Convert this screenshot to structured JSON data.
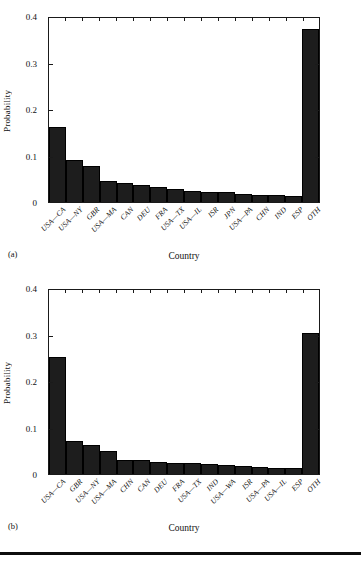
{
  "figure": {
    "panels": [
      {
        "tag": "(a)",
        "xaxis_title": "Country",
        "yaxis_title": "Probability"
      },
      {
        "tag": "(b)",
        "xaxis_title": "Country",
        "yaxis_title": "Probability"
      }
    ],
    "accent_color": "#1d1d1d",
    "axis_color": "#1a1a1a",
    "background_color": "#ffffff"
  },
  "chart_data": [
    {
      "type": "bar",
      "panel": "(a)",
      "title": "",
      "xlabel": "Country",
      "ylabel": "Probability",
      "ylim": [
        0,
        0.4
      ],
      "yticks": [
        0,
        0.1,
        0.2,
        0.3,
        0.4
      ],
      "ytick_labels": [
        "0",
        "0.1",
        "0.2",
        "0.3",
        "0.4"
      ],
      "grid": false,
      "legend": "none",
      "categories": [
        "USA—CA",
        "USA—NY",
        "GBR",
        "USA—MA",
        "CAN",
        "DEU",
        "FRA",
        "USA—TX",
        "USA—IL",
        "ISR",
        "JPN",
        "USA—PA",
        "CHN",
        "IND",
        "ESP",
        "OTH"
      ],
      "values": [
        0.162,
        0.092,
        0.079,
        0.046,
        0.042,
        0.037,
        0.033,
        0.029,
        0.025,
        0.022,
        0.021,
        0.018,
        0.016,
        0.015,
        0.014,
        0.377
      ]
    },
    {
      "type": "bar",
      "panel": "(b)",
      "title": "",
      "xlabel": "Country",
      "ylabel": "Probability",
      "ylim": [
        0,
        0.4
      ],
      "yticks": [
        0,
        0.1,
        0.2,
        0.3,
        0.4
      ],
      "ytick_labels": [
        "0",
        "0.1",
        "0.2",
        "0.3",
        "0.4"
      ],
      "grid": false,
      "legend": "none",
      "categories": [
        "USA—CA",
        "GBR",
        "USA—NY",
        "USA—MA",
        "CHN",
        "CAN",
        "DEU",
        "FRA",
        "USA—TX",
        "IND",
        "USA—WA",
        "ISR",
        "USA—PA",
        "USA—IL",
        "ESP",
        "OTH"
      ],
      "values": [
        0.255,
        0.072,
        0.063,
        0.049,
        0.031,
        0.03,
        0.027,
        0.025,
        0.024,
        0.022,
        0.019,
        0.018,
        0.015,
        0.013,
        0.013,
        0.307
      ]
    }
  ]
}
